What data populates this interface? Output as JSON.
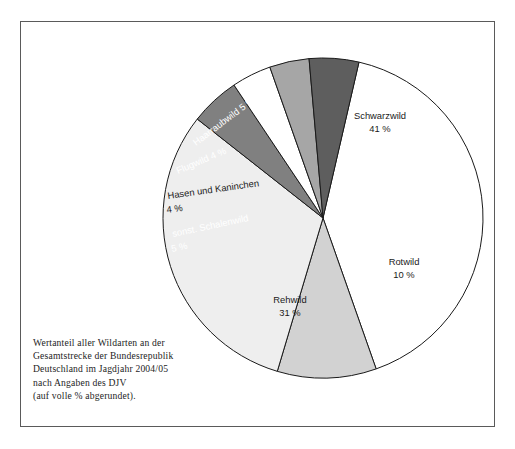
{
  "figure": {
    "background_color": "#ffffff",
    "frame_color": "#5a5a5a",
    "caption_lines": [
      "Wertanteil aller Wildarten an der",
      "Gesamtstrecke der Bundesrepublik",
      "Deutschland im Jagdjahr 2004/05",
      "nach Angaben des DJV",
      "(auf volle % abgerundet)."
    ]
  },
  "chart_data": {
    "type": "pie",
    "title": "",
    "subtitle": "",
    "xlabel": "",
    "ylabel": "",
    "legend_position": "none",
    "grid": false,
    "units": "%",
    "total": 100,
    "start_angle_deg": -77,
    "direction": "clockwise",
    "categories": [
      "Schwarzwild",
      "Rotwild",
      "Rehwild",
      "sonst. Schalenwild",
      "Hasen und Kaninchen",
      "Flugwild",
      "Haarraubwild"
    ],
    "values": [
      41,
      10,
      31,
      5,
      4,
      4,
      5
    ],
    "slices": [
      {
        "name": "Schwarzwild",
        "value": 41,
        "label": "Schwarzwild",
        "value_label": "41 %",
        "fill": "#ffffff",
        "text_color": "#1a1a1a",
        "label_rotation_deg": 0,
        "label_x": 380,
        "label_y": 119,
        "value_x": 380,
        "value_y": 132,
        "text_anchor": "middle"
      },
      {
        "name": "Rotwild",
        "value": 10,
        "label": "Rotwild",
        "value_label": "10 %",
        "fill": "#d2d2d2",
        "text_color": "#1a1a1a",
        "label_rotation_deg": 0,
        "label_x": 404,
        "label_y": 265,
        "value_x": 404,
        "value_y": 278,
        "text_anchor": "middle"
      },
      {
        "name": "Rehwild",
        "value": 31,
        "label": "Rehwild",
        "value_label": "31 %",
        "fill": "#eeeeee",
        "text_color": "#1a1a1a",
        "label_rotation_deg": 0,
        "label_x": 290,
        "label_y": 303,
        "value_x": 290,
        "value_y": 316,
        "text_anchor": "middle"
      },
      {
        "name": "sonst. Schalenwild",
        "value": 5,
        "label": "sonst. Schalenwild",
        "value_label": "5 %",
        "fill": "#808080",
        "text_color": "#ffffff",
        "label_rotation_deg": -12,
        "label_x": 173,
        "label_y": 237,
        "value_x": 172,
        "value_y": 252,
        "text_anchor": "start"
      },
      {
        "name": "Hasen und Kaninchen",
        "value": 4,
        "label": "Hasen und Kaninchen",
        "value_label": "4 %",
        "fill": "#ffffff",
        "text_color": "#1a1a1a",
        "label_rotation_deg": -8,
        "label_x": 168,
        "label_y": 199,
        "value_x": 167,
        "value_y": 213,
        "text_anchor": "start"
      },
      {
        "name": "Flugwild",
        "value": 4,
        "label": "Flugwild 4 %",
        "value_label": "",
        "fill": "#a6a6a6",
        "text_color": "#ffffff",
        "label_rotation_deg": -23,
        "label_x": 178,
        "label_y": 174,
        "value_x": 0,
        "value_y": 0,
        "text_anchor": "start"
      },
      {
        "name": "Haarraubwild",
        "value": 5,
        "label": "Haarraubwild 5 %",
        "value_label": "",
        "fill": "#5e5e5e",
        "text_color": "#ffffff",
        "label_rotation_deg": -37,
        "label_x": 196,
        "label_y": 146,
        "value_x": 0,
        "value_y": 0,
        "text_anchor": "start"
      }
    ],
    "geometry": {
      "center_x": 323,
      "center_y": 218,
      "radius": 160
    }
  }
}
